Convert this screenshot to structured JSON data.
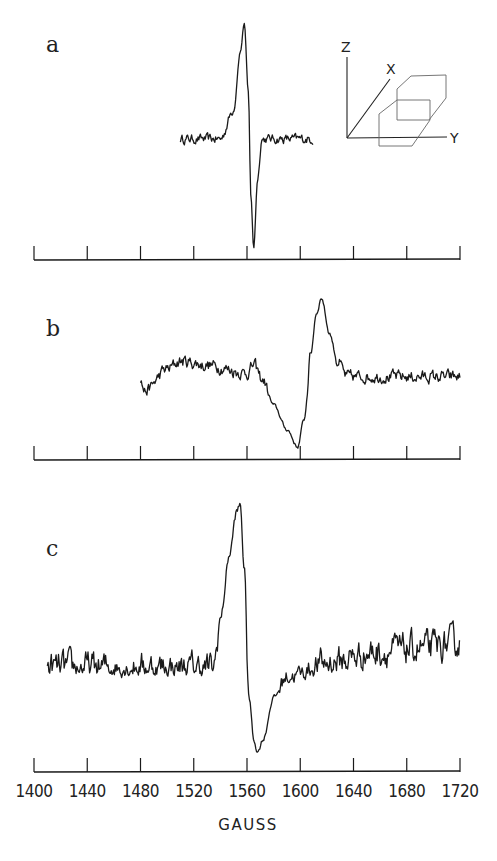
{
  "chart_data": {
    "type": "line",
    "xlabel": "GAUSS",
    "xlim": [
      1400,
      1720
    ],
    "x_ticks": [
      1400,
      1440,
      1480,
      1520,
      1560,
      1600,
      1640,
      1680,
      1720
    ],
    "x_tick_labels": [
      "1400",
      "1440",
      "1480",
      "1520",
      "1560",
      "1600",
      "1640",
      "1680",
      "1720"
    ],
    "y_units": "arbitrary (derivative EPR signal)",
    "panels": [
      {
        "label": "a",
        "description": "sharp derivative signal with low noise",
        "x_range": [
          1510,
          1610
        ],
        "baseline": 0.0,
        "key_points": [
          {
            "x": 1510,
            "y": 0.0
          },
          {
            "x": 1540,
            "y": 0.0
          },
          {
            "x": 1550,
            "y": 0.25
          },
          {
            "x": 1555,
            "y": 0.75
          },
          {
            "x": 1558,
            "y": 1.0
          },
          {
            "x": 1561,
            "y": 0.4
          },
          {
            "x": 1563,
            "y": -0.5
          },
          {
            "x": 1565,
            "y": -0.95
          },
          {
            "x": 1568,
            "y": -0.35
          },
          {
            "x": 1571,
            "y": 0.0
          },
          {
            "x": 1610,
            "y": 0.0
          }
        ],
        "noise": 0.03
      },
      {
        "label": "b",
        "description": "broad noisy derivative signal",
        "x_range": [
          1480,
          1720
        ],
        "baseline": 0.0,
        "key_points": [
          {
            "x": 1480,
            "y": -0.05
          },
          {
            "x": 1483,
            "y": -0.2
          },
          {
            "x": 1500,
            "y": 0.1
          },
          {
            "x": 1510,
            "y": 0.2
          },
          {
            "x": 1530,
            "y": 0.15
          },
          {
            "x": 1560,
            "y": 0.05
          },
          {
            "x": 1565,
            "y": 0.15
          },
          {
            "x": 1572,
            "y": -0.05
          },
          {
            "x": 1580,
            "y": -0.4
          },
          {
            "x": 1590,
            "y": -0.75
          },
          {
            "x": 1598,
            "y": -1.0
          },
          {
            "x": 1603,
            "y": -0.6
          },
          {
            "x": 1608,
            "y": 0.3
          },
          {
            "x": 1612,
            "y": 0.8
          },
          {
            "x": 1616,
            "y": 1.0
          },
          {
            "x": 1622,
            "y": 0.55
          },
          {
            "x": 1628,
            "y": 0.2
          },
          {
            "x": 1635,
            "y": 0.0
          },
          {
            "x": 1720,
            "y": 0.0
          }
        ],
        "noise": 0.06
      },
      {
        "label": "c",
        "description": "noisy derivative signal with rising baseline",
        "x_range": [
          1410,
          1720
        ],
        "baseline": 0.0,
        "key_points": [
          {
            "x": 1410,
            "y": 0.0
          },
          {
            "x": 1535,
            "y": 0.0
          },
          {
            "x": 1540,
            "y": 0.3
          },
          {
            "x": 1547,
            "y": 0.7
          },
          {
            "x": 1552,
            "y": 0.95
          },
          {
            "x": 1555,
            "y": 1.0
          },
          {
            "x": 1558,
            "y": 0.6
          },
          {
            "x": 1562,
            "y": -0.4
          },
          {
            "x": 1565,
            "y": -0.85
          },
          {
            "x": 1568,
            "y": -1.0
          },
          {
            "x": 1572,
            "y": -0.85
          },
          {
            "x": 1580,
            "y": -0.35
          },
          {
            "x": 1590,
            "y": -0.1
          },
          {
            "x": 1620,
            "y": 0.03
          },
          {
            "x": 1660,
            "y": 0.1
          },
          {
            "x": 1690,
            "y": 0.12
          },
          {
            "x": 1720,
            "y": 0.15
          }
        ],
        "noise": 0.07
      }
    ],
    "inset": {
      "axes": [
        "Z",
        "X",
        "Y"
      ],
      "description": "coordinate frame with naphthalene-like fused-hexagon molecule outline"
    }
  }
}
